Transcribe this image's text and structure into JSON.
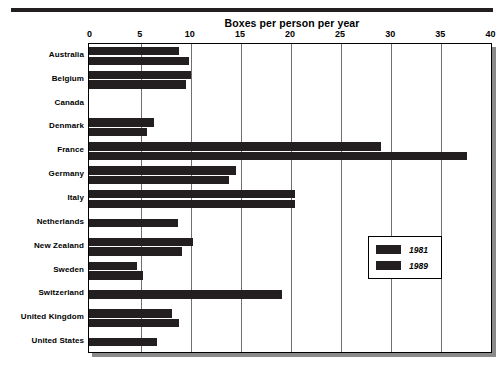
{
  "chart_data": {
    "type": "bar",
    "orientation": "horizontal",
    "title": "Boxes per person per year",
    "xlabel": "",
    "ylabel": "",
    "xlim": [
      0,
      40
    ],
    "xticks": [
      0,
      5,
      10,
      15,
      20,
      25,
      30,
      35,
      40
    ],
    "xtick_labels": [
      "0",
      "5",
      "10",
      "15",
      "20",
      "25",
      "30",
      "35",
      "40"
    ],
    "grid": true,
    "legend_position": "center-right",
    "categories": [
      "Australia",
      "Belgium",
      "Canada",
      "Denmark",
      "France",
      "Germany",
      "Italy",
      "Netherlands",
      "New Zealand",
      "Sweden",
      "Switzerland",
      "United Kingdom",
      "United States"
    ],
    "series": [
      {
        "name": "1981",
        "color": "#231f20",
        "values": [
          8.8,
          10.0,
          null,
          6.3,
          29.0,
          14.5,
          20.4,
          null,
          10.2,
          4.6,
          null,
          8.1,
          null
        ]
      },
      {
        "name": "1989",
        "color": "#231f20",
        "values": [
          9.8,
          9.5,
          null,
          5.6,
          37.6,
          13.8,
          20.4,
          8.7,
          9.1,
          5.2,
          19.1,
          8.8,
          6.6
        ]
      }
    ]
  },
  "legend": {
    "entries": [
      {
        "label": "1981"
      },
      {
        "label": "1989"
      }
    ]
  },
  "colors": {
    "bar": "#231f20",
    "grid": "#6f6f6f",
    "frame": "#000000",
    "shadow": "#8a8a8a",
    "background": "#ffffff"
  }
}
